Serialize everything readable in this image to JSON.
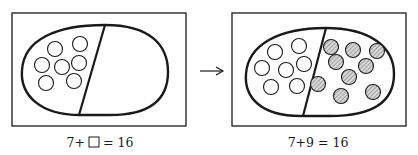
{
  "panels": [
    {
      "name": "before",
      "caption_parts": [
        "7+",
        "",
        " = 16"
      ],
      "left_circles": 7,
      "right_circles": 0,
      "has_unknown_box": true
    },
    {
      "name": "after",
      "caption": "7+9 = 16",
      "left_circles": 7,
      "right_circles": 9,
      "has_unknown_box": false
    }
  ],
  "arrow": "right-arrow",
  "colors": {
    "ink": "#1a1a1a",
    "hatch": "#9a9a9a",
    "background": "#ffffff"
  }
}
